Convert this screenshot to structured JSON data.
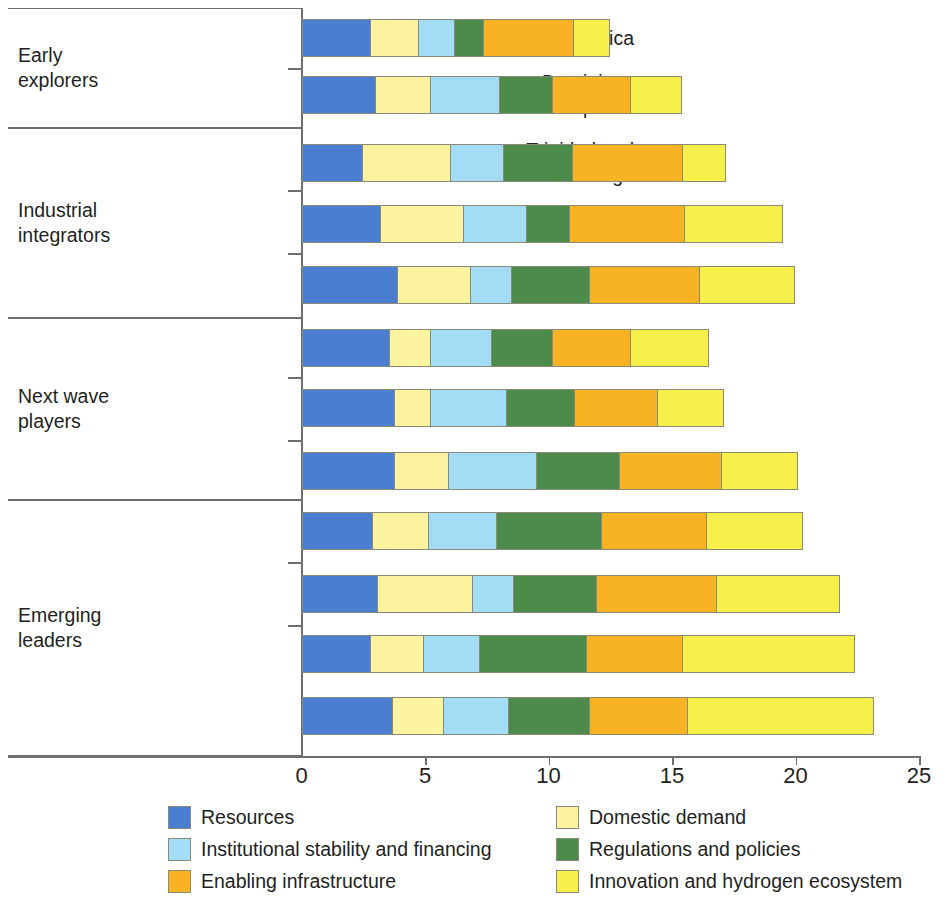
{
  "chart_data": {
    "type": "bar",
    "orientation": "horizontal",
    "stacked": true,
    "title": "",
    "xlabel": "",
    "ylabel": "",
    "xlim": [
      0,
      25
    ],
    "xticks": [
      0,
      5,
      10,
      15,
      20,
      25
    ],
    "xtick_labels": [
      "0",
      "5",
      "10",
      "15",
      "20",
      "25"
    ],
    "grid": false,
    "legend_position": "bottom",
    "categories": [
      "Jamaica",
      "Dominican\nRepublic",
      "Trinidad and\nTobago",
      "Mexico",
      "Argentina",
      "Paraguay",
      "Costa Rica",
      "Panama",
      "Uruguay",
      "Brazil",
      "Colombia",
      "Chile"
    ],
    "series": [
      {
        "name": "Resources",
        "color": "#4a7ed1",
        "values": [
          2.8,
          3.0,
          2.5,
          3.2,
          3.9,
          3.6,
          3.8,
          3.8,
          2.9,
          3.1,
          2.8,
          3.7
        ]
      },
      {
        "name": "Domestic demand",
        "color": "#fbf3a0",
        "values": [
          2.0,
          2.3,
          3.6,
          3.4,
          3.0,
          1.7,
          1.5,
          2.2,
          2.3,
          3.9,
          2.2,
          2.1
        ]
      },
      {
        "name": "Institutional stability and financing",
        "color": "#a2dcf5",
        "values": [
          1.5,
          2.8,
          2.2,
          2.6,
          1.7,
          2.5,
          3.1,
          3.6,
          2.8,
          1.7,
          2.3,
          2.7
        ]
      },
      {
        "name": "Regulations and policies",
        "color": "#4d8b4a",
        "values": [
          1.2,
          2.2,
          2.8,
          1.8,
          3.2,
          2.5,
          2.8,
          3.4,
          4.3,
          3.4,
          4.4,
          3.3
        ]
      },
      {
        "name": "Enabling infrastructure",
        "color": "#f7b324",
        "values": [
          3.7,
          3.2,
          4.5,
          4.7,
          4.5,
          3.2,
          3.4,
          4.2,
          4.3,
          4.9,
          3.9,
          4.0
        ]
      },
      {
        "name": "Innovation and hydrogen ecosystem",
        "color": "#f7f04a",
        "values": [
          1.5,
          2.1,
          1.8,
          4.0,
          3.9,
          3.2,
          2.7,
          3.1,
          3.9,
          5.0,
          7.0,
          7.6
        ]
      }
    ],
    "totals": [
      12.7,
      15.6,
      17.4,
      19.7,
      20.2,
      16.7,
      17.3,
      20.3,
      20.5,
      22.0,
      22.6,
      23.4
    ],
    "groups": [
      {
        "label": "Early\nexplorers",
        "members": [
          "Jamaica",
          "Dominican\nRepublic"
        ]
      },
      {
        "label": "Industrial\nintegrators",
        "members": [
          "Trinidad and\nTobago",
          "Mexico",
          "Argentina"
        ]
      },
      {
        "label": "Next wave\nplayers",
        "members": [
          "Paraguay",
          "Costa Rica",
          "Panama"
        ]
      },
      {
        "label": "Emerging\nleaders",
        "members": [
          "Uruguay",
          "Brazil",
          "Colombia",
          "Chile"
        ]
      }
    ]
  },
  "legend": {
    "items": [
      {
        "label": "Resources",
        "color": "#4a7ed1"
      },
      {
        "label": "Domestic demand",
        "color": "#fbf3a0"
      },
      {
        "label": "Institutional stability and financing",
        "color": "#a2dcf5"
      },
      {
        "label": "Regulations and policies",
        "color": "#4d8b4a"
      },
      {
        "label": "Enabling infrastructure",
        "color": "#f7b324"
      },
      {
        "label": "Innovation and hydrogen ecosystem",
        "color": "#f7f04a"
      }
    ]
  },
  "axis": {
    "tick_labels": [
      "0",
      "5",
      "10",
      "15",
      "20",
      "25"
    ]
  }
}
